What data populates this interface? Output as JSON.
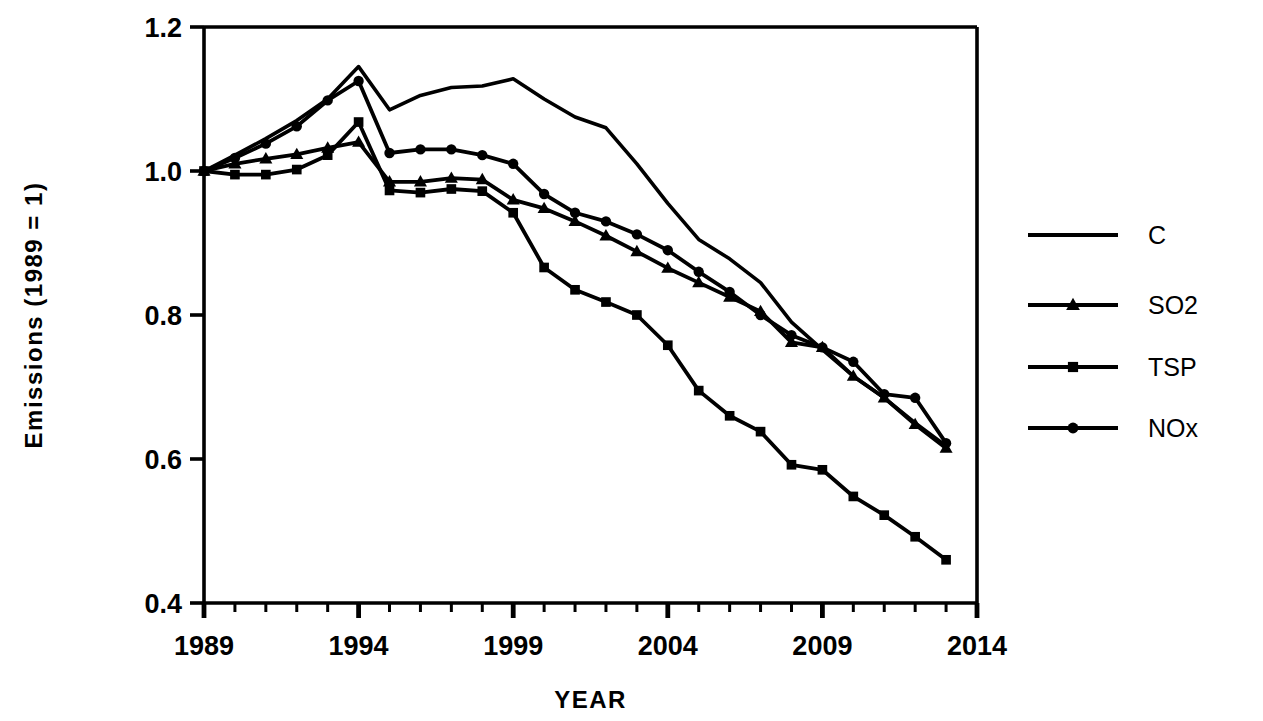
{
  "chart_data": {
    "type": "line",
    "title": "",
    "xlabel": "YEAR",
    "ylabel": "Emissions  (1989 = 1)",
    "xlim": [
      1989,
      2014
    ],
    "ylim": [
      0.4,
      1.2
    ],
    "grid": false,
    "legend_position": "right",
    "x_tick_labels": [
      "1989",
      "1994",
      "1999",
      "2004",
      "2009",
      "2014"
    ],
    "x_tick_values": [
      1989,
      1994,
      1999,
      2004,
      2009,
      2014
    ],
    "x_minor_tick_step": 1,
    "y_tick_labels": [
      "0.4",
      "0.6",
      "0.8",
      "1.0",
      "1.2"
    ],
    "y_tick_values": [
      0.4,
      0.6,
      0.8,
      1.0,
      1.2
    ],
    "x": [
      1989,
      1990,
      1991,
      1992,
      1993,
      1994,
      1995,
      1996,
      1997,
      1998,
      1999,
      2000,
      2001,
      2002,
      2003,
      2004,
      2005,
      2006,
      2007,
      2008,
      2009,
      2010,
      2011,
      2012,
      2013
    ],
    "series": [
      {
        "name": "C",
        "marker": "none",
        "values": [
          1.0,
          1.022,
          1.045,
          1.07,
          1.1,
          1.145,
          1.085,
          1.105,
          1.116,
          1.118,
          1.128,
          1.1,
          1.075,
          1.06,
          1.01,
          0.955,
          0.905,
          0.878,
          0.845,
          0.79,
          0.752,
          0.715,
          0.685,
          0.65,
          0.618
        ]
      },
      {
        "name": "SO2",
        "marker": "triangle",
        "values": [
          1.0,
          1.01,
          1.017,
          1.023,
          1.032,
          1.04,
          0.985,
          0.985,
          0.99,
          0.988,
          0.96,
          0.948,
          0.93,
          0.91,
          0.888,
          0.865,
          0.845,
          0.825,
          0.805,
          0.762,
          0.755,
          0.715,
          0.685,
          0.648,
          0.615
        ]
      },
      {
        "name": "TSP",
        "marker": "square",
        "values": [
          1.0,
          0.995,
          0.995,
          1.002,
          1.022,
          1.068,
          0.973,
          0.97,
          0.975,
          0.972,
          0.942,
          0.866,
          0.835,
          0.818,
          0.8,
          0.758,
          0.695,
          0.66,
          0.638,
          0.592,
          0.585,
          0.548,
          0.522,
          0.492,
          0.46
        ]
      },
      {
        "name": "NOx",
        "marker": "circle",
        "values": [
          1.0,
          1.018,
          1.038,
          1.062,
          1.098,
          1.125,
          1.025,
          1.03,
          1.03,
          1.022,
          1.01,
          0.968,
          0.942,
          0.93,
          0.912,
          0.89,
          0.86,
          0.832,
          0.8,
          0.772,
          0.755,
          0.735,
          0.69,
          0.685,
          0.622
        ]
      }
    ]
  },
  "legend": {
    "entries": [
      {
        "label": "C",
        "marker": "none"
      },
      {
        "label": "SO2",
        "marker": "triangle"
      },
      {
        "label": "TSP",
        "marker": "square"
      },
      {
        "label": "NOx",
        "marker": "circle"
      }
    ]
  },
  "colors": {
    "line": "#000000",
    "axis": "#000000",
    "background": "#ffffff"
  }
}
